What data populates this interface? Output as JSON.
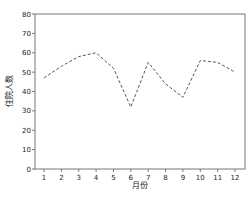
{
  "chart_data": {
    "type": "line",
    "title": "",
    "xlabel": "月份",
    "ylabel": "住院人数",
    "x": [
      1,
      2,
      3,
      4,
      5,
      6,
      7,
      8,
      9,
      10,
      11,
      12
    ],
    "categories": [
      "1",
      "2",
      "3",
      "4",
      "5",
      "6",
      "7",
      "8",
      "9",
      "10",
      "11",
      "12"
    ],
    "series": [
      {
        "name": "住院人数",
        "values": [
          47,
          53,
          58,
          60,
          52,
          32,
          55,
          44,
          37,
          56,
          55,
          50
        ],
        "style": "dashed",
        "color": "#555555"
      }
    ],
    "ylim": [
      0,
      80
    ],
    "yticks": [
      0,
      10,
      20,
      30,
      40,
      50,
      60,
      70,
      80
    ],
    "grid": false,
    "legend": "none"
  }
}
